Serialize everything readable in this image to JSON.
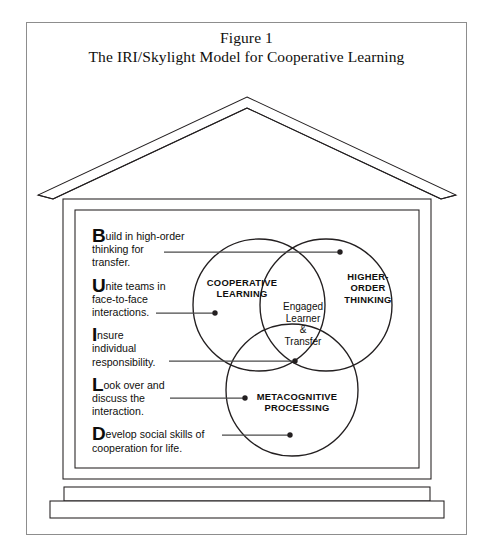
{
  "figure": {
    "title_line1": "Figure 1",
    "title_line2": "The IRI/Skylight Model for Cooperative Learning"
  },
  "build_acronym": {
    "items": [
      {
        "letter": "B",
        "rest": "uild in high-order",
        "line2": "thinking for",
        "line3": "transfer."
      },
      {
        "letter": "U",
        "rest": "nite teams in",
        "line2": "face-to-face",
        "line3": "interactions."
      },
      {
        "letter": "I",
        "rest": "nsure",
        "line2": "individual",
        "line3": "responsibility."
      },
      {
        "letter": "L",
        "rest": "ook over and",
        "line2": "discuss the",
        "line3": "interaction."
      },
      {
        "letter": "D",
        "rest": "evelop social skills of",
        "line2": "cooperation for life.",
        "line3": ""
      }
    ]
  },
  "venn": {
    "circle_cooperative": "COOPERATIVE\nLEARNING",
    "circle_cooperative_l1": "COOPERATIVE",
    "circle_cooperative_l2": "LEARNING",
    "circle_higher_l1": "HIGHER-",
    "circle_higher_l2": "ORDER",
    "circle_higher_l3": "THINKING",
    "circle_meta_l1": "METACOGNITIVE",
    "circle_meta_l2": "PROCESSING",
    "center_l1": "Engaged",
    "center_l2": "Learner",
    "center_l3": "&",
    "center_l4": "Transfer"
  },
  "colors": {
    "ink": "#100f0d",
    "frame": "#8d8d8d",
    "stroke": "#231f20",
    "leader": "#4a4a4a",
    "paper": "#ffffff"
  }
}
